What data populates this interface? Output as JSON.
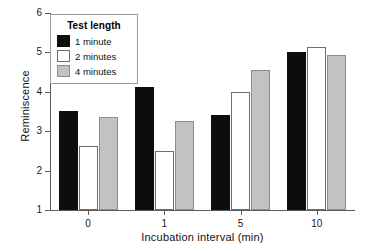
{
  "chart_data": {
    "type": "bar",
    "title": "",
    "subtitle": "",
    "xlabel": "Incubation interval (min)",
    "ylabel": "Reminiscence",
    "categories": [
      "0",
      "1",
      "5",
      "10"
    ],
    "series": [
      {
        "name": "1 minute",
        "values": [
          3.51,
          4.11,
          3.4,
          5.0
        ],
        "color": "#0d0d0d"
      },
      {
        "name": "2 minutes",
        "values": [
          2.63,
          2.51,
          4.0,
          5.15
        ],
        "color": "#ffffff"
      },
      {
        "name": "4 minutes",
        "values": [
          3.36,
          3.27,
          4.56,
          4.93
        ],
        "color": "#c2c2c2"
      }
    ],
    "ylim": [
      1,
      6
    ],
    "yticks": [
      "1",
      "2",
      "3",
      "4",
      "5",
      "6"
    ],
    "grid": false,
    "legend": {
      "title": "Test length",
      "position": "top-left"
    }
  },
  "legend": {
    "title": "Test length",
    "entries": [
      {
        "label": "1 minute"
      },
      {
        "label": "2 minutes"
      },
      {
        "label": "4 minutes"
      }
    ]
  },
  "axes": {
    "x_title": "Incubation interval (min)",
    "y_title": "Reminiscence",
    "x_tick_labels": [
      "0",
      "1",
      "5",
      "10"
    ],
    "y_tick_labels": [
      "1",
      "2",
      "3",
      "4",
      "5",
      "6"
    ]
  }
}
